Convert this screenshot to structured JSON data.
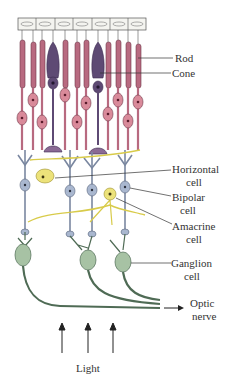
{
  "colors": {
    "rod": "#b86a80",
    "rod_dark": "#6e3848",
    "cone": "#5e4a74",
    "cell_body": "#d98a9a",
    "bipolar": "#a9b7cf",
    "horizontal": "#ece27a",
    "amacrine": "#ece27a",
    "ganglion": "#a7c2a4",
    "ganglion_outline": "#4f6b55",
    "pigment": "#f4f4f0",
    "line": "#333333"
  },
  "labels": {
    "rod": "Rod",
    "cone": "Cone",
    "horizontal_1": "Horizontal",
    "horizontal_2": "cell",
    "bipolar_1": "Bipolar",
    "bipolar_2": "cell",
    "amacrine_1": "Amacrine",
    "amacrine_2": "cell",
    "ganglion_1": "Ganglion",
    "ganglion_2": "cell",
    "optic_1": "Optic",
    "optic_2": "nerve",
    "light": "Light"
  },
  "layers": [
    {
      "name": "pigment-epithelium",
      "count": 7
    },
    {
      "name": "photoreceptors",
      "rods": 10,
      "cones": 2
    },
    {
      "name": "horizontal-cells",
      "count": 1
    },
    {
      "name": "bipolar-cells",
      "count": 4
    },
    {
      "name": "amacrine-cells",
      "count": 1
    },
    {
      "name": "ganglion-cells",
      "count": 3
    }
  ],
  "light_arrows": 3
}
